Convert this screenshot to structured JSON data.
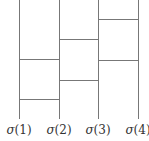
{
  "diagram": {
    "type": "ladder (amidakuji) diagram",
    "line_color": "#777777",
    "vertical_lines": [
      {
        "id": 1,
        "x": 19,
        "y_top": 0,
        "y_bottom": 119
      },
      {
        "id": 2,
        "x": 59,
        "y_top": 0,
        "y_bottom": 119
      },
      {
        "id": 3,
        "x": 98,
        "y_top": 0,
        "y_bottom": 119
      },
      {
        "id": 4,
        "x": 138,
        "y_top": 0,
        "y_bottom": 119
      }
    ],
    "rungs": [
      {
        "between": [
          3,
          4
        ],
        "y": 19
      },
      {
        "between": [
          2,
          3
        ],
        "y": 39
      },
      {
        "between": [
          1,
          2
        ],
        "y": 59
      },
      {
        "between": [
          3,
          4
        ],
        "y": 60
      },
      {
        "between": [
          2,
          3
        ],
        "y": 80
      },
      {
        "between": [
          1,
          2
        ],
        "y": 99
      }
    ],
    "labels": [
      {
        "symbol": "σ",
        "arg": "(1)"
      },
      {
        "symbol": "σ",
        "arg": "(2)"
      },
      {
        "symbol": "σ",
        "arg": "(3)"
      },
      {
        "symbol": "σ",
        "arg": "(4)"
      }
    ]
  }
}
